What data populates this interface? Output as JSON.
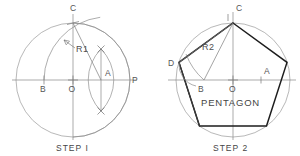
{
  "figure": {
    "background_color": "#ffffff",
    "line_color": "#8a8a8a",
    "pentagon_color": "#1d1d1d",
    "text_color": "#4a4a4a"
  },
  "step1": {
    "caption": "STEP I",
    "points": {
      "C": "C",
      "O": "O",
      "B": "B",
      "A": "A",
      "P": "P"
    },
    "radius_label": "R1",
    "geometry": {
      "center": [
        73,
        80
      ],
      "radius": 57,
      "point_C": [
        73,
        23
      ],
      "point_O": [
        73,
        80
      ],
      "point_P": [
        130,
        80
      ],
      "point_A": [
        101,
        80
      ],
      "point_B": [
        44,
        80
      ],
      "arc_R1_radius": 63.8,
      "lens_half_width": 14,
      "lens_half_height": 31
    }
  },
  "step2": {
    "caption": "STEP 2",
    "name_label": "PENTAGON",
    "points": {
      "C": "C",
      "D": "D",
      "O": "O",
      "B": "B",
      "A": "A"
    },
    "radius_label": "R2",
    "geometry": {
      "center": [
        233,
        80
      ],
      "radius": 57,
      "point_C": [
        233,
        23
      ],
      "point_O": [
        233,
        80
      ],
      "point_A": [
        261,
        80
      ],
      "point_B": [
        204,
        80
      ],
      "vertices": [
        [
          233,
          23
        ],
        [
          287,
          62.4
        ],
        [
          266.5,
          126
        ],
        [
          199.5,
          126
        ],
        [
          179,
          62.4
        ]
      ],
      "arc_R2_radius": 67
    }
  }
}
